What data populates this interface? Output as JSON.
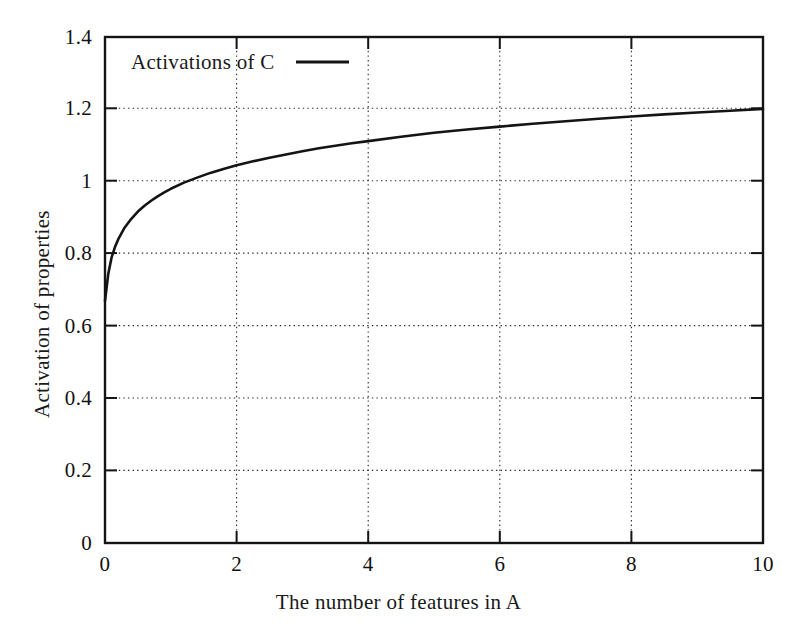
{
  "chart_data": {
    "type": "line",
    "title": "",
    "xlabel": "The number of features in A",
    "ylabel": "Activation of properties",
    "xlim": [
      0,
      10
    ],
    "ylim": [
      0,
      1.4
    ],
    "xticks": [
      "0",
      "2",
      "4",
      "6",
      "8",
      "10"
    ],
    "xtick_values": [
      0,
      2,
      4,
      6,
      8,
      10
    ],
    "yticks": [
      "0",
      "0.2",
      "0.4",
      "0.6",
      "0.8",
      "1",
      "1.2",
      "1.4"
    ],
    "ytick_values": [
      0,
      0.2,
      0.4,
      0.6,
      0.8,
      1,
      1.2,
      1.4
    ],
    "grid": true,
    "grid_style": "dotted",
    "legend_position": "top-left-inside",
    "series": [
      {
        "name": "Activations of C",
        "line_style": "solid",
        "color": "#141414",
        "x": [
          0,
          0.05,
          0.1,
          0.15,
          0.2,
          0.3,
          0.4,
          0.5,
          0.6,
          0.7,
          0.8,
          0.9,
          1.0,
          1.2,
          1.4,
          1.6,
          1.8,
          2.0,
          2.25,
          2.5,
          2.75,
          3.0,
          3.25,
          3.5,
          3.75,
          4.0,
          4.5,
          5.0,
          5.5,
          6.0,
          6.5,
          7.0,
          7.5,
          8.0,
          8.5,
          9.0,
          9.5,
          10.0
        ],
        "y": [
          0.67,
          0.745,
          0.79,
          0.818,
          0.84,
          0.873,
          0.897,
          0.917,
          0.933,
          0.947,
          0.959,
          0.97,
          0.98,
          0.997,
          1.011,
          1.024,
          1.035,
          1.045,
          1.056,
          1.066,
          1.075,
          1.084,
          1.092,
          1.099,
          1.106,
          1.112,
          1.124,
          1.135,
          1.144,
          1.152,
          1.16,
          1.167,
          1.174,
          1.18,
          1.186,
          1.191,
          1.196,
          1.201
        ]
      }
    ],
    "legend_entries": [
      {
        "label": "Activations of C",
        "sample": "solid-line"
      }
    ]
  },
  "axes": {
    "y_tick_labels": [
      "1.4",
      "1.2",
      "1",
      "0.8",
      "0.6",
      "0.4",
      "0.2",
      "0"
    ],
    "x_tick_labels": [
      "0",
      "2",
      "4",
      "6",
      "8",
      "10"
    ]
  },
  "labels": {
    "y_axis_title": "Activation of properties",
    "x_axis_title": "The number of features in A",
    "legend_series_name": "Activations of C"
  }
}
